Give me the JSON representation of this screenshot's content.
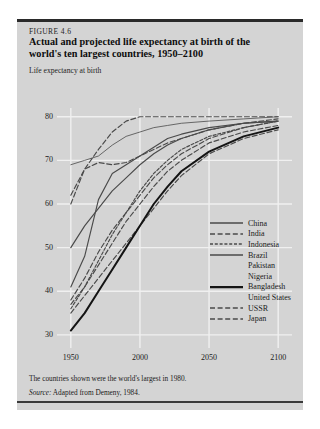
{
  "figure": {
    "number": "FIGURE 4.6",
    "title_line1": "Actual and projected life expectancy at birth of the",
    "title_line2": "world's ten largest countries, 1950–2100",
    "axis_caption": "Life expectancy at birth",
    "footnote": "The countries shown were the world's largest in 1980.",
    "source_label": "Source:",
    "source_text": " Adapted from Demeny, 1984."
  },
  "chart_data": {
    "type": "line",
    "title": "Actual and projected life expectancy at birth of the world's ten largest countries, 1950–2100",
    "xlabel": "",
    "ylabel": "Life expectancy at birth",
    "xlim": [
      1940,
      2110
    ],
    "ylim": [
      27,
      82
    ],
    "xticks": [
      1950,
      2000,
      2050,
      2100
    ],
    "yticks": [
      30,
      40,
      50,
      60,
      70,
      80
    ],
    "grid": true,
    "legend_position": "right-inside",
    "colors": {
      "line": "#4a4a4a",
      "bold_line": "#141414",
      "grid": "#f0f0f0",
      "background": "#d4d4d4"
    },
    "series": [
      {
        "name": "China",
        "style": "solid",
        "weight": "medium",
        "x": [
          1950,
          1960,
          1970,
          1980,
          1990,
          2000,
          2010,
          2020,
          2030,
          2050,
          2075,
          2100
        ],
        "values": [
          41,
          48,
          61,
          67,
          69,
          71,
          73,
          75,
          76,
          77.5,
          78.5,
          79
        ]
      },
      {
        "name": "India",
        "style": "dashed",
        "weight": "medium",
        "x": [
          1950,
          1960,
          1970,
          1980,
          1990,
          2000,
          2010,
          2020,
          2030,
          2050,
          2075,
          2100
        ],
        "values": [
          38,
          43,
          49,
          54,
          58,
          62,
          66,
          69,
          71.5,
          75,
          77.5,
          79
        ]
      },
      {
        "name": "Indonesia",
        "style": "dashed-dense",
        "weight": "medium",
        "x": [
          1950,
          1960,
          1970,
          1980,
          1990,
          2000,
          2010,
          2020,
          2030,
          2050,
          2075,
          2100
        ],
        "values": [
          36,
          41,
          47,
          53,
          58,
          63,
          67,
          70,
          72.5,
          75.5,
          77.5,
          79
        ]
      },
      {
        "name": "Brazil",
        "style": "solid",
        "weight": "medium",
        "x": [
          1950,
          1960,
          1970,
          1980,
          1990,
          2000,
          2010,
          2020,
          2030,
          2050,
          2075,
          2100
        ],
        "values": [
          50,
          55,
          59,
          63,
          66,
          69,
          71.5,
          73.5,
          75,
          77,
          78.5,
          79
        ]
      },
      {
        "name": "Pakistan",
        "style": "dashed",
        "weight": "medium",
        "x": [
          1950,
          1960,
          1970,
          1980,
          1990,
          2000,
          2010,
          2020,
          2030,
          2050,
          2075,
          2100
        ],
        "values": [
          37,
          41,
          46,
          51,
          56,
          60,
          64,
          67.5,
          70,
          74,
          76.5,
          78
        ]
      },
      {
        "name": "Nigeria",
        "style": "dashed",
        "weight": "medium",
        "x": [
          1950,
          1960,
          1970,
          1980,
          1990,
          2000,
          2010,
          2020,
          2030,
          2050,
          2075,
          2100
        ],
        "values": [
          35,
          39,
          43,
          47,
          51,
          55,
          59,
          63,
          66.5,
          71.5,
          75,
          77
        ]
      },
      {
        "name": "Bangladesh",
        "style": "solid",
        "weight": "bold",
        "x": [
          1950,
          1960,
          1970,
          1980,
          1990,
          2000,
          2010,
          2020,
          2030,
          2050,
          2075,
          2100
        ],
        "values": [
          31,
          35,
          40,
          45,
          50,
          55,
          60,
          64,
          67.5,
          72,
          75.5,
          77.5
        ]
      },
      {
        "name": "United States",
        "style": "solid",
        "weight": "thin",
        "x": [
          1950,
          1960,
          1970,
          1980,
          1990,
          2000,
          2010,
          2020,
          2030,
          2050,
          2075,
          2100
        ],
        "values": [
          69,
          70,
          71,
          73.5,
          75.5,
          76.5,
          77.5,
          78,
          78.5,
          79,
          79.5,
          80
        ]
      },
      {
        "name": "USSR",
        "style": "dashed",
        "weight": "medium",
        "x": [
          1950,
          1960,
          1970,
          1980,
          1990,
          2000,
          2010,
          2020,
          2030,
          2050,
          2075,
          2100
        ],
        "values": [
          62,
          68,
          69.5,
          69,
          69.5,
          71,
          72.5,
          74,
          75,
          77,
          78.5,
          79.5
        ]
      },
      {
        "name": "Japan",
        "style": "dashed",
        "weight": "medium",
        "x": [
          1950,
          1960,
          1970,
          1980,
          1990,
          2000,
          2010,
          2020,
          2030,
          2050,
          2075,
          2100
        ],
        "values": [
          60,
          68,
          72.5,
          76.5,
          79,
          80,
          80,
          80,
          80,
          80,
          80,
          80
        ]
      }
    ]
  },
  "legend": {
    "items": [
      {
        "label": "China",
        "style": "solid",
        "weight": "medium"
      },
      {
        "label": "India",
        "style": "dashed",
        "weight": "medium"
      },
      {
        "label": "Indonesia",
        "style": "dashed-dense",
        "weight": "medium"
      },
      {
        "label": "Brazil",
        "style": "solid",
        "weight": "medium"
      },
      {
        "label": "Pakistan",
        "style": "none",
        "weight": "medium"
      },
      {
        "label": "Nigeria",
        "style": "none",
        "weight": "medium"
      },
      {
        "label": "Bangladesh",
        "style": "solid",
        "weight": "bold"
      },
      {
        "label": "United States",
        "style": "none",
        "weight": "thin"
      },
      {
        "label": "USSR",
        "style": "dashed",
        "weight": "medium"
      },
      {
        "label": "Japan",
        "style": "dashed",
        "weight": "medium"
      }
    ]
  }
}
